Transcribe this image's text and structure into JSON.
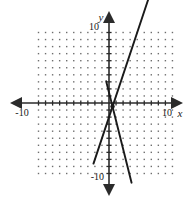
{
  "chart_data": {
    "type": "line",
    "title": "",
    "xlabel": "x",
    "ylabel": "y",
    "xlim": [
      -10,
      10
    ],
    "ylim": [
      -10,
      10
    ],
    "grid": "dot-grid",
    "grid_step": 1,
    "legend": "none",
    "axis_arrows": true,
    "tick_labels": {
      "x_left": "-10",
      "x_right": "10",
      "y_top": "10",
      "y_bottom": "-10"
    },
    "series": [
      {
        "name": "rising-line",
        "direction": "increasing",
        "slope": 3,
        "intercept": -2,
        "points": [
          [
            -2.2,
            -8.6
          ],
          [
            6.2,
            16.6
          ]
        ],
        "color": "#1a1a1a"
      },
      {
        "name": "falling-line",
        "direction": "decreasing",
        "slope": -4,
        "intercept": 1.5,
        "points": [
          [
            -0.4,
            3.1
          ],
          [
            3.2,
            -11.3
          ]
        ],
        "color": "#1a1a1a"
      }
    ],
    "intersection": {
      "x": 0.5,
      "y": -0.5,
      "marked": true
    }
  },
  "labels": {
    "x_axis": "x",
    "y_axis": "y",
    "x_min": "-10",
    "x_max": "10",
    "y_max": "10",
    "y_min": "-10"
  },
  "colors": {
    "line": "#1a1a1a",
    "axis": "#2b2b2b",
    "grid_dot": "#6e6e6e",
    "background": "#ffffff"
  }
}
